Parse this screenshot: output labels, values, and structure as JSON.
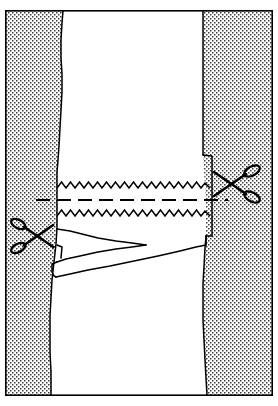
{
  "figure": {
    "kind": "line-drawing",
    "caption": "",
    "width": 278,
    "height": 406,
    "background_color": "#ffffff",
    "ink_color": "#000000",
    "stipple_color": "#3a3a3a",
    "fabric_fill": "#ffffff"
  },
  "frame": {
    "name": "outer-border",
    "x": 5,
    "y": 10,
    "width": 268,
    "height": 386,
    "stroke_color": "#000000",
    "stroke_width": 1.6
  },
  "regions": [
    {
      "id": "left-stipple-panel",
      "label": "left stippled background",
      "fill": "stipple",
      "description": "dotted texture region at left of fabric panel"
    },
    {
      "id": "right-stipple-panel",
      "label": "right stippled background",
      "fill": "stipple",
      "description": "dotted texture region at right of fabric panel"
    },
    {
      "id": "fabric-panel",
      "label": "fabric panel",
      "fill": "#ffffff",
      "description": "white vertical strip of fabric running top to bottom"
    },
    {
      "id": "folded-flap",
      "label": "folded seam flap",
      "fill": "#ffffff",
      "description": "turned-back fabric flap below the lower pinked edge"
    }
  ],
  "paths": {
    "fabric_left_edge": "M 63 11 L 62 23 L 61 40 L 61 58 L 62 74 L 62 92 L 61 110 L 60 128 L 59 146 L 58 160 L 57 172 L 57 186 L 57 200 L 57 214 L 57 228 L 56 244 L 54 262 L 52 280 L 51 298 L 50 316 L 50 334 L 50 352 L 51 372 L 51 395",
    "fabric_right_edge": "M 203 11 L 203 30 L 203 52 L 203 74 L 203 96 L 203 118 L 203 140 L 203 155 L 204 170 L 205 186 L 206 202 L 206 218 L 206 232 L 205 248 L 204 266 L 203 284 L 203 302 L 203 320 L 204 340 L 205 360 L 206 378 L 207 395",
    "notch_right": "M 206 157 L 212 157 L 212 236 L 206 236",
    "flap_outline": "M 58 230 L 70 231 L 80 234 L 96 238 L 116 241 L 134 243 L 146 244 L 140 247 L 124 249 L 104 252 L 84 256 L 68 260 L 58 264 L 54 268 L 53 276 L 56 278 L 64 277 L 78 274 L 96 270 L 116 265 L 138 260 L 160 255 L 178 250 L 194 246 L 204 244",
    "flap_inner": "M 58 246 L 62 248 L 60 260",
    "zigzag_top": {
      "x_start": 58,
      "x_end": 204,
      "y_base": 186,
      "amplitude": 5,
      "wavelength": 9
    },
    "zigzag_bottom": {
      "x_start": 58,
      "x_end": 204,
      "y_base": 214,
      "amplitude": 5,
      "wavelength": 9
    },
    "dashed_line": {
      "y": 200,
      "x_start": 36,
      "x_end": 228,
      "dash": "14 7",
      "stroke_width": 2.2
    }
  },
  "markers": {
    "scissors": [
      {
        "id": "scissors-right",
        "label": "cut here (right)",
        "cx": 236,
        "cy": 184,
        "rotation": 0,
        "handles_side": "right",
        "scale": 1.0
      },
      {
        "id": "scissors-left",
        "label": "cut here (left)",
        "cx": 33,
        "cy": 236,
        "rotation": 0,
        "handles_side": "left",
        "scale": 0.92
      }
    ]
  },
  "annotations": {
    "stitch_line_label": "",
    "cut_line_label": "",
    "notes": ""
  }
}
